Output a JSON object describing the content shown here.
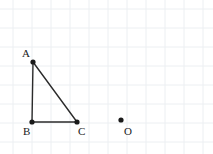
{
  "figure": {
    "width": 213,
    "height": 154,
    "background_color": "#ffffff",
    "grid": {
      "visible": true,
      "spacing": 19,
      "origin_x": 13,
      "origin_y": 9,
      "color": "#eceff2",
      "line_width": 1,
      "vertical_lines_x": [
        13,
        32,
        51,
        70,
        89,
        108,
        127,
        146,
        165,
        184,
        203
      ],
      "horizontal_lines_y": [
        9,
        28,
        47,
        66,
        85,
        104,
        123,
        142
      ]
    },
    "stroke_color": "#2b2b2b",
    "stroke_width": 1.4,
    "point_color": "#1a1a1a",
    "point_radius": 2.6,
    "points": [
      {
        "id": "A",
        "label": "A",
        "x": 33,
        "y": 62,
        "label_x": 22,
        "label_y": 48
      },
      {
        "id": "B",
        "label": "B",
        "x": 32,
        "y": 122,
        "label_x": 23,
        "label_y": 126
      },
      {
        "id": "C",
        "label": "C",
        "x": 77,
        "y": 122,
        "label_x": 78,
        "label_y": 126
      },
      {
        "id": "O",
        "label": "O",
        "x": 121,
        "y": 120,
        "label_x": 124,
        "label_y": 126
      }
    ],
    "segments": [
      {
        "id": "AB",
        "from": "A",
        "to": "B"
      },
      {
        "id": "BC",
        "from": "B",
        "to": "C"
      },
      {
        "id": "CA",
        "from": "C",
        "to": "A"
      }
    ],
    "shape": {
      "name": "triangle-ABC",
      "vertices": [
        "A",
        "B",
        "C"
      ],
      "right_angle_at": "B"
    }
  }
}
